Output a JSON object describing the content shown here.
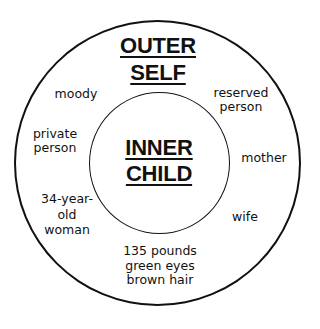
{
  "diagram": {
    "colors": {
      "background": "#ffffff",
      "stroke": "#111111",
      "text": "#111111"
    },
    "outer": {
      "title_lines": [
        "OUTER",
        "SELF"
      ]
    },
    "inner": {
      "title_lines": [
        "INNER",
        "CHILD"
      ]
    },
    "labels": [
      {
        "id": "moody",
        "lines": [
          "moody"
        ]
      },
      {
        "id": "reserved-person",
        "lines": [
          "reserved",
          "person"
        ]
      },
      {
        "id": "private-person",
        "lines": [
          "private",
          "person"
        ]
      },
      {
        "id": "mother",
        "lines": [
          "mother"
        ]
      },
      {
        "id": "34-year-old-woman",
        "lines": [
          "34-year-",
          "old",
          "woman"
        ]
      },
      {
        "id": "wife",
        "lines": [
          "wife"
        ]
      },
      {
        "id": "physical-description",
        "lines": [
          "135 pounds",
          "green eyes",
          "brown hair"
        ]
      }
    ]
  }
}
